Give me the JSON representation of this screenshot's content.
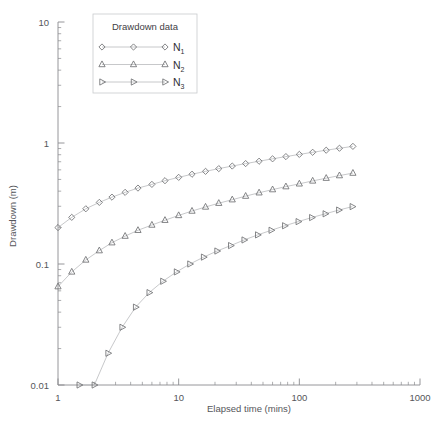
{
  "chart_data": {
    "type": "scatter",
    "title": "",
    "xlabel": "Elapsed time (mins)",
    "ylabel": "Drawdown (m)",
    "xscale": "log",
    "yscale": "log",
    "xlim": [
      1,
      1000
    ],
    "ylim": [
      0.01,
      10
    ],
    "xticks": [
      1,
      10,
      100,
      1000
    ],
    "xtick_labels": [
      "1",
      "10",
      "100",
      "1000"
    ],
    "yticks": [
      0.01,
      0.1,
      1,
      10
    ],
    "ytick_labels": [
      "0.01",
      "0.1",
      "1",
      "10"
    ],
    "grid": false,
    "legend_position": "upper-center",
    "legend_title": "Drawdown data",
    "series": [
      {
        "name": "N1",
        "label": "N",
        "sub": "1",
        "marker": "diamond",
        "color": "#6f7073",
        "points": [
          [
            1.0,
            0.2
          ],
          [
            1.3,
            0.243
          ],
          [
            1.7,
            0.286
          ],
          [
            2.2,
            0.323
          ],
          [
            2.8,
            0.357
          ],
          [
            3.6,
            0.391
          ],
          [
            4.6,
            0.424
          ],
          [
            6.0,
            0.455
          ],
          [
            7.7,
            0.488
          ],
          [
            10.0,
            0.52
          ],
          [
            12.9,
            0.552
          ],
          [
            16.7,
            0.583
          ],
          [
            21.5,
            0.614
          ],
          [
            27.8,
            0.645
          ],
          [
            35.9,
            0.676
          ],
          [
            46.4,
            0.707
          ],
          [
            60.0,
            0.74
          ],
          [
            77.4,
            0.772
          ],
          [
            100.0,
            0.805
          ],
          [
            129.0,
            0.838
          ],
          [
            167.0,
            0.872
          ],
          [
            215.0,
            0.905
          ],
          [
            278.0,
            0.938
          ]
        ]
      },
      {
        "name": "N2",
        "label": "N",
        "sub": "2",
        "marker": "triangle-up",
        "color": "#6f7073",
        "points": [
          [
            1.0,
            0.065
          ],
          [
            1.3,
            0.086
          ],
          [
            1.7,
            0.108
          ],
          [
            2.2,
            0.129
          ],
          [
            2.8,
            0.15
          ],
          [
            3.6,
            0.17
          ],
          [
            4.6,
            0.19
          ],
          [
            6.0,
            0.21
          ],
          [
            7.7,
            0.23
          ],
          [
            10.0,
            0.252
          ],
          [
            12.9,
            0.274
          ],
          [
            16.7,
            0.296
          ],
          [
            21.5,
            0.318
          ],
          [
            27.8,
            0.34
          ],
          [
            35.9,
            0.364
          ],
          [
            46.4,
            0.388
          ],
          [
            60.0,
            0.412
          ],
          [
            77.4,
            0.436
          ],
          [
            100.0,
            0.46
          ],
          [
            129.0,
            0.486
          ],
          [
            167.0,
            0.512
          ],
          [
            215.0,
            0.538
          ],
          [
            278.0,
            0.564
          ]
        ]
      },
      {
        "name": "N3",
        "label": "N",
        "sub": "3",
        "marker": "triangle-right",
        "color": "#6f7073",
        "points": [
          [
            1.5,
            0.01
          ],
          [
            2.0,
            0.01
          ],
          [
            2.6,
            0.0183
          ],
          [
            3.4,
            0.03
          ],
          [
            4.4,
            0.044
          ],
          [
            5.7,
            0.058
          ],
          [
            7.4,
            0.072
          ],
          [
            9.6,
            0.086
          ],
          [
            12.4,
            0.1
          ],
          [
            16.1,
            0.114
          ],
          [
            20.8,
            0.128
          ],
          [
            27.0,
            0.142
          ],
          [
            34.9,
            0.158
          ],
          [
            45.2,
            0.174
          ],
          [
            58.5,
            0.19
          ],
          [
            75.7,
            0.207
          ],
          [
            98.0,
            0.224
          ],
          [
            126.8,
            0.242
          ],
          [
            164.1,
            0.26
          ],
          [
            212.4,
            0.279
          ],
          [
            274.9,
            0.298
          ]
        ]
      }
    ]
  },
  "legend": {
    "title": "Drawdown data",
    "entries": [
      {
        "label": "N",
        "sub": "1",
        "marker": "diamond"
      },
      {
        "label": "N",
        "sub": "2",
        "marker": "triangle-up"
      },
      {
        "label": "N",
        "sub": "3",
        "marker": "triangle-right"
      }
    ]
  },
  "axes": {
    "x_title": "Elapsed time (mins)",
    "y_title": "Drawdown (m)"
  },
  "colors": {
    "marker": "#6f7073",
    "line": "#b9babd",
    "axis": "#8a8b8e",
    "text": "#55565a"
  }
}
